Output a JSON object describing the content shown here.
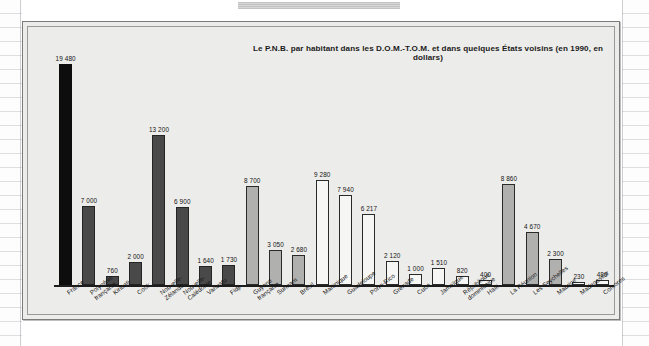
{
  "figure": {
    "title": "Le P.N.B. par habitant dans les D.O.M.-T.O.M. et dans quelques États voisins (en 1990, en dollars)"
  },
  "chart_data": {
    "type": "bar",
    "title": "Le P.N.B. par habitant dans les D.O.M.-T.O.M. et dans quelques États voisins (en 1990, en dollars)",
    "xlabel": "",
    "ylabel": "",
    "ylim": [
      0,
      19480
    ],
    "grid": false,
    "legend": "none",
    "value_format": "space-separated thousands",
    "categories": [
      "France",
      "Polynésie française",
      "Kiribati",
      "Cook",
      "Nouvelle-Zélande",
      "Nouvelle-Calédonie",
      "Vanuatu",
      "Fidji",
      "Guyane française",
      "Surinam",
      "Brésil",
      "Martinique",
      "Guadeloupe",
      "Porto-Rico",
      "Grenade",
      "Cuba",
      "Jamaïque",
      "République dominicaine",
      "Haïti",
      "La Réunion",
      "Les Seychelles",
      "Maurice",
      "Madagascar",
      "Comores"
    ],
    "values": [
      19480,
      7000,
      760,
      2000,
      13200,
      6900,
      1640,
      1730,
      8700,
      3050,
      2680,
      9280,
      7940,
      6217,
      2120,
      1000,
      1510,
      820,
      400,
      8860,
      4670,
      2300,
      230,
      480
    ],
    "value_labels": [
      "19 480",
      "7 000",
      "760",
      "2 000",
      "13 200",
      "6 900",
      "1 640",
      "1 730",
      "8 700",
      "3 050",
      "2 680",
      "9 280",
      "7 940",
      "6 217",
      "2 120",
      "1 000",
      "1 510",
      "820",
      "400",
      "8 860",
      "4 670",
      "2 300",
      "230",
      "480"
    ],
    "label_lines": [
      [
        "France"
      ],
      [
        "Polynésie",
        "française"
      ],
      [
        "Kiribati"
      ],
      [
        "Cook"
      ],
      [
        "Nouvelle-",
        "Zélande"
      ],
      [
        "Nouvelle-",
        "Calédonie"
      ],
      [
        "Vanuatu"
      ],
      [
        "Fidji"
      ],
      [
        "Guyane",
        "française"
      ],
      [
        "Surinam"
      ],
      [
        "Brésil"
      ],
      [
        "Martinique"
      ],
      [
        "Guadeloupe"
      ],
      [
        "Porto-Rico"
      ],
      [
        "Grenade"
      ],
      [
        "Cuba"
      ],
      [
        "Jamaïque"
      ],
      [
        "République",
        "dominicaine"
      ],
      [
        "Haïti"
      ],
      [
        "La Réunion"
      ],
      [
        "Les Seychelles"
      ],
      [
        "Maurice"
      ],
      [
        "Madagascar"
      ],
      [
        "Comores"
      ]
    ],
    "bar_styles": [
      "black",
      "dark",
      "dark",
      "dark",
      "dark",
      "dark",
      "dark",
      "dark",
      "mid",
      "mid",
      "mid",
      "white",
      "white",
      "white",
      "white",
      "white",
      "white",
      "white",
      "white",
      "mid",
      "mid",
      "mid",
      "white",
      "white"
    ],
    "colors": {
      "black": "#0d0d0d",
      "dark": "#49494a",
      "mid": "#b0b0ae",
      "white": "#f6f6f4",
      "outline": "#1d1d1d",
      "plot_background": "#ececea",
      "frame_border": "#7b7b7b"
    }
  }
}
